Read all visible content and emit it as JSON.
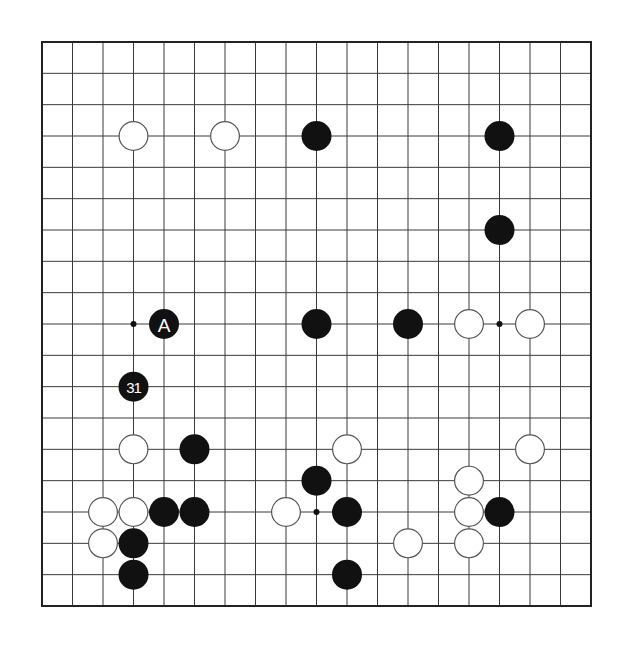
{
  "board": {
    "size": 19,
    "origin_x": 42,
    "origin_y": 42,
    "end_x": 591,
    "end_y": 606,
    "stone_radius": 15,
    "colors": {
      "black": "#111111",
      "white": "#ffffff",
      "line": "#3a3a3a",
      "background": "#ffffff"
    }
  },
  "star_points": [
    {
      "col": 3,
      "row": 9
    },
    {
      "col": 15,
      "row": 9
    },
    {
      "col": 9,
      "row": 15
    }
  ],
  "stones": [
    {
      "color": "white",
      "col": 3,
      "row": 3
    },
    {
      "color": "white",
      "col": 6,
      "row": 3
    },
    {
      "color": "black",
      "col": 9,
      "row": 3
    },
    {
      "color": "black",
      "col": 15,
      "row": 3
    },
    {
      "color": "black",
      "col": 15,
      "row": 6
    },
    {
      "color": "black",
      "col": 4,
      "row": 9,
      "label": "A"
    },
    {
      "color": "black",
      "col": 9,
      "row": 9
    },
    {
      "color": "black",
      "col": 12,
      "row": 9
    },
    {
      "color": "white",
      "col": 14,
      "row": 9
    },
    {
      "color": "white",
      "col": 16,
      "row": 9
    },
    {
      "color": "black",
      "col": 3,
      "row": 11,
      "label": "31"
    },
    {
      "color": "white",
      "col": 3,
      "row": 13
    },
    {
      "color": "black",
      "col": 5,
      "row": 13
    },
    {
      "color": "white",
      "col": 10,
      "row": 13
    },
    {
      "color": "white",
      "col": 16,
      "row": 13
    },
    {
      "color": "black",
      "col": 9,
      "row": 14
    },
    {
      "color": "white",
      "col": 14,
      "row": 14
    },
    {
      "color": "white",
      "col": 2,
      "row": 15
    },
    {
      "color": "white",
      "col": 3,
      "row": 15
    },
    {
      "color": "black",
      "col": 4,
      "row": 15
    },
    {
      "color": "black",
      "col": 5,
      "row": 15
    },
    {
      "color": "white",
      "col": 8,
      "row": 15
    },
    {
      "color": "black",
      "col": 10,
      "row": 15
    },
    {
      "color": "white",
      "col": 14,
      "row": 15
    },
    {
      "color": "black",
      "col": 15,
      "row": 15
    },
    {
      "color": "white",
      "col": 2,
      "row": 16
    },
    {
      "color": "black",
      "col": 3,
      "row": 16
    },
    {
      "color": "white",
      "col": 12,
      "row": 16
    },
    {
      "color": "white",
      "col": 14,
      "row": 16
    },
    {
      "color": "black",
      "col": 3,
      "row": 17
    },
    {
      "color": "black",
      "col": 10,
      "row": 17
    }
  ]
}
